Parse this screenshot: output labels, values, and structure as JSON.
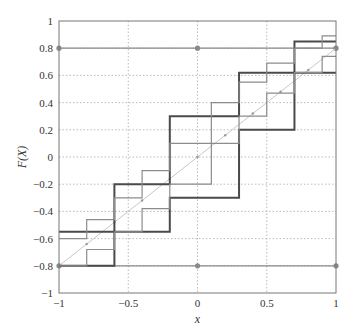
{
  "chart_data": {
    "type": "line",
    "title": "",
    "xlabel": "x",
    "ylabel": "F(X)",
    "xlim": [
      -1,
      1
    ],
    "ylim": [
      -1,
      1
    ],
    "grid": true,
    "x_ticks": [
      "-1",
      "-0.5",
      "0",
      "0.5",
      "1"
    ],
    "x_tick_values": [
      -1,
      -0.5,
      0,
      0.5,
      1
    ],
    "y_ticks": [
      "-1",
      "-0.8",
      "-0.6",
      "-0.4",
      "-0.2",
      "0",
      "0.2",
      "0.4",
      "0.6",
      "0.8",
      "1"
    ],
    "y_tick_values": [
      -1,
      -0.8,
      -0.6,
      -0.4,
      -0.2,
      0,
      0.2,
      0.4,
      0.6,
      0.8,
      1
    ],
    "series": [
      {
        "name": "upper bound line",
        "style": "solid-gray-markers",
        "color": "#8a8a8a",
        "points": [
          [
            -1,
            0.8
          ],
          [
            0,
            0.8
          ],
          [
            1,
            0.8
          ]
        ]
      },
      {
        "name": "lower bound line",
        "style": "solid-gray-markers",
        "color": "#8a8a8a",
        "points": [
          [
            -1,
            -0.8
          ],
          [
            0,
            -0.8
          ],
          [
            1,
            -0.8
          ]
        ]
      },
      {
        "name": "F(x) diagonal",
        "style": "light-line-dots",
        "color": "#c8c8c8",
        "points": [
          [
            -1,
            -0.8
          ],
          [
            -0.8,
            -0.64
          ],
          [
            -0.6,
            -0.48
          ],
          [
            -0.4,
            -0.32
          ],
          [
            -0.2,
            -0.16
          ],
          [
            0,
            0
          ],
          [
            0.2,
            0.16
          ],
          [
            0.4,
            0.32
          ],
          [
            0.6,
            0.48
          ],
          [
            0.8,
            0.64
          ],
          [
            1,
            0.8
          ]
        ]
      },
      {
        "name": "upper step (coarse)",
        "style": "thick-step",
        "color": "#4a4a4a",
        "steps": [
          [
            -1,
            -0.6,
            -0.55
          ],
          [
            -0.6,
            -0.2,
            -0.2
          ],
          [
            -0.2,
            0.3,
            0.3
          ],
          [
            0.3,
            0.7,
            0.62
          ],
          [
            0.7,
            1,
            0.85
          ]
        ]
      },
      {
        "name": "lower step (coarse)",
        "style": "thick-step",
        "color": "#4a4a4a",
        "steps": [
          [
            -1,
            -0.6,
            -0.8
          ],
          [
            -0.6,
            -0.2,
            -0.55
          ],
          [
            -0.2,
            0.3,
            -0.3
          ],
          [
            0.3,
            0.7,
            0.2
          ],
          [
            0.7,
            1,
            0.62
          ]
        ]
      },
      {
        "name": "upper step (fine)",
        "style": "medium-step",
        "color": "#8c8c8c",
        "steps": [
          [
            -1,
            -0.8,
            -0.6
          ],
          [
            -0.8,
            -0.6,
            -0.46
          ],
          [
            -0.6,
            -0.4,
            -0.3
          ],
          [
            -0.4,
            -0.2,
            -0.1
          ],
          [
            -0.2,
            0.1,
            0.1
          ],
          [
            0.1,
            0.3,
            0.4
          ],
          [
            0.3,
            0.5,
            0.55
          ],
          [
            0.5,
            0.7,
            0.69
          ],
          [
            0.7,
            0.9,
            0.8
          ],
          [
            0.9,
            1,
            0.89
          ]
        ]
      },
      {
        "name": "lower step (fine)",
        "style": "medium-step",
        "color": "#8c8c8c",
        "steps": [
          [
            -1,
            -0.8,
            -0.8
          ],
          [
            -0.8,
            -0.6,
            -0.68
          ],
          [
            -0.6,
            -0.4,
            -0.55
          ],
          [
            -0.4,
            -0.2,
            -0.38
          ],
          [
            -0.2,
            0.1,
            -0.2
          ],
          [
            0.1,
            0.3,
            0.1
          ],
          [
            0.3,
            0.5,
            0.3
          ],
          [
            0.5,
            0.7,
            0.47
          ],
          [
            0.7,
            0.9,
            0.62
          ],
          [
            0.9,
            1,
            0.74
          ]
        ]
      }
    ]
  }
}
